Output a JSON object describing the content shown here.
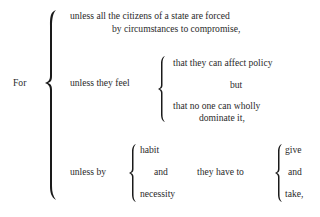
{
  "lead": "For",
  "clause1": {
    "line1": "unless all the citizens of a state are forced",
    "line2": "by circumstances to compromise,"
  },
  "clause2": {
    "label": "unless they feel",
    "option1": "that they can affect policy",
    "connector": "but",
    "option2_line1": "that no one can wholly",
    "option2_line2": "dominate it,"
  },
  "clause3": {
    "label": "unless by",
    "means": [
      "habit",
      "and",
      "necessity"
    ],
    "middle": "they have to",
    "actions": [
      "give",
      "and",
      "take,"
    ]
  }
}
